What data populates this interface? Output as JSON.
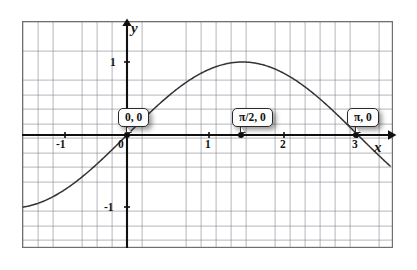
{
  "figure": {
    "name": "sine-curve-graph",
    "background_color": "#ffffff",
    "frame_color": "#6f6f6f",
    "grid_color": "#7878874f",
    "axis_color": "#101010",
    "curve_color": "#333333"
  },
  "axes": {
    "x_letter": "x",
    "y_letter": "y",
    "x_tick_labels": [
      "-1",
      "0",
      "1",
      "2",
      "3"
    ],
    "x_tick_values": [
      -1,
      0,
      1,
      2,
      3
    ],
    "y_tick_labels": [
      "1",
      "-1"
    ],
    "y_tick_values": [
      1,
      -1
    ],
    "x_range": [
      -1.43,
      3.58
    ],
    "y_range": [
      -1.57,
      1.57
    ],
    "grid": "on",
    "origin_label": "0"
  },
  "callouts": [
    {
      "id": "origin",
      "label": "0, 0",
      "x": 0,
      "y": 0
    },
    {
      "id": "half-pi",
      "label": "π/2, 0",
      "x": 1.5708,
      "y": 0
    },
    {
      "id": "pi",
      "label": "π, 0",
      "x": 3.1416,
      "y": 0
    }
  ],
  "chart_data": {
    "type": "line",
    "title": "",
    "xlabel": "x",
    "ylabel": "y",
    "xlim": [
      -1.43,
      3.58
    ],
    "ylim": [
      -1.57,
      1.57
    ],
    "grid": true,
    "legend": "none",
    "series": [
      {
        "name": "sin(x)",
        "expression": "y = sin(x)",
        "x": [
          -1.43,
          -1.3,
          -1.15,
          -1.0,
          -0.85,
          -0.7,
          -0.55,
          -0.4,
          -0.25,
          -0.1,
          0.0,
          0.15,
          0.3,
          0.45,
          0.6,
          0.75,
          0.9,
          1.05,
          1.2,
          1.35,
          1.5708,
          1.7,
          1.85,
          2.0,
          2.2,
          2.4,
          2.6,
          2.8,
          3.0,
          3.1416,
          3.3,
          3.45,
          3.58
        ],
        "y": [
          -0.99,
          -0.964,
          -0.913,
          -0.841,
          -0.751,
          -0.644,
          -0.523,
          -0.389,
          -0.247,
          -0.0998,
          0.0,
          0.149,
          0.296,
          0.435,
          0.565,
          0.682,
          0.783,
          0.867,
          0.932,
          0.976,
          1.0,
          0.992,
          0.961,
          0.909,
          0.808,
          0.675,
          0.516,
          0.335,
          0.141,
          0.0,
          -0.158,
          -0.304,
          -0.424
        ]
      }
    ],
    "annotations": [
      {
        "text": "0, 0",
        "x": 0,
        "y": 0
      },
      {
        "text": "π/2, 0",
        "x": 1.5708,
        "y": 0
      },
      {
        "text": "π, 0",
        "x": 3.1416,
        "y": 0
      }
    ],
    "xticks": [
      -1,
      0,
      1,
      2,
      3
    ],
    "xticklabels": [
      "-1",
      "0",
      "1",
      "2",
      "3"
    ],
    "yticks": [
      1,
      -1
    ],
    "yticklabels": [
      "1",
      "-1"
    ]
  },
  "ticks": {
    "x": [
      {
        "label": "-1",
        "left": 56,
        "top": 139
      },
      {
        "label": "0",
        "left": 118,
        "top": 139
      },
      {
        "label": "1",
        "left": 204,
        "top": 139
      },
      {
        "label": "2",
        "left": 279,
        "top": 139
      },
      {
        "label": "3",
        "left": 351,
        "top": 139
      }
    ],
    "y": [
      {
        "label": "1",
        "left": 109,
        "top": 57
      },
      {
        "label": "-1",
        "left": 104,
        "top": 200
      }
    ]
  }
}
